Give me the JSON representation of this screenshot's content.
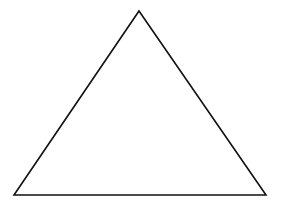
{
  "diagram": {
    "shape": "triangle",
    "type": "isosceles-outline",
    "stroke_color": "#111111",
    "fill_color": "#ffffff",
    "background_color": "#ffffff",
    "stroke_width": 1.6,
    "vertices": {
      "apex": {
        "x": 139,
        "y": 11
      },
      "bottom_left": {
        "x": 14,
        "y": 195
      },
      "bottom_right": {
        "x": 266,
        "y": 195
      }
    }
  }
}
